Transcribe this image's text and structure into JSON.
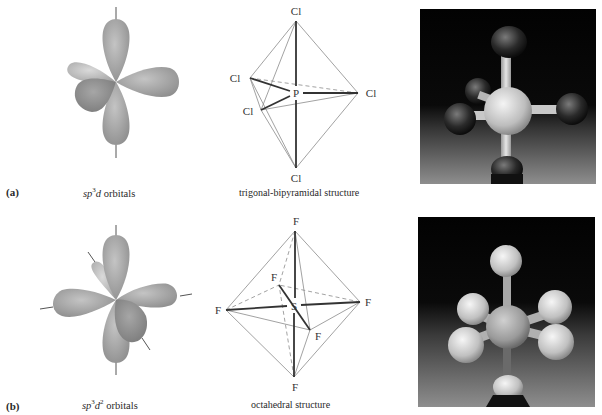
{
  "figure": {
    "panels": [
      {
        "id": "a",
        "label": "(a)",
        "orbital_caption": {
          "prefix": "sp",
          "sup1": "3",
          "mid": "d",
          "sup2": "",
          "suffix": " orbitals"
        },
        "structure_caption": "trigonal-bipyramidal structure",
        "molecule": {
          "central_atom": "P",
          "ligands": [
            "Cl",
            "Cl",
            "Cl",
            "Cl",
            "Cl"
          ]
        },
        "photo_description": "ball-and-stick model, dark ligand spheres on light central atom"
      },
      {
        "id": "b",
        "label": "(b)",
        "orbital_caption": {
          "prefix": "sp",
          "sup1": "3",
          "mid": "d",
          "sup2": "2",
          "suffix": " orbitals"
        },
        "structure_caption": "octahedral structure",
        "molecule": {
          "central_atom": "S",
          "ligands": [
            "F",
            "F",
            "F",
            "F",
            "F",
            "F"
          ]
        },
        "photo_description": "ball-and-stick model, light ligand spheres on central atom"
      }
    ],
    "colors": {
      "orbital_light": "#c8c8c8",
      "orbital_mid": "#a9a9a9",
      "orbital_dark": "#8f8f8f",
      "line": "#444444",
      "thin_line": "#8a8a8a",
      "photo_bg_top": "#050505",
      "photo_bg_bottom": "#8a8a8a"
    }
  }
}
